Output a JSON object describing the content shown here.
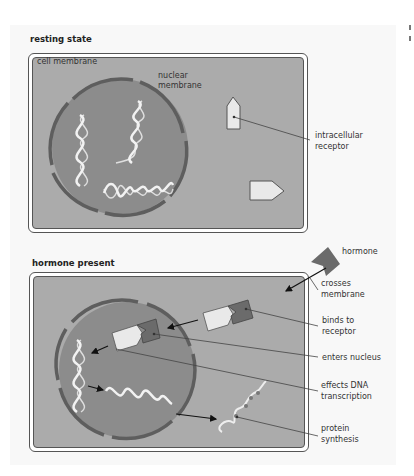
{
  "panels": [
    {
      "title": "resting state",
      "labels": {
        "cell_membrane": "cell membrane",
        "nuclear_membrane_1": "nuclear",
        "nuclear_membrane_2": "membrane",
        "dna": "DNA",
        "intracellular_receptor_1": "intracellular",
        "intracellular_receptor_2": "receptor"
      }
    },
    {
      "title": "hormone present",
      "labels": {
        "hormone": "hormone",
        "mrna": "mRNA",
        "steps": [
          {
            "line1": "crosses",
            "line2": "membrane"
          },
          {
            "line1": "binds to",
            "line2": "receptor"
          },
          {
            "line1": "enters nucleus",
            "line2": ""
          },
          {
            "line1": "effects DNA",
            "line2": "transcription"
          },
          {
            "line1": "protein",
            "line2": "synthesis"
          }
        ]
      }
    }
  ],
  "colors": {
    "cytoplasm": "#ababab",
    "nucleus": "#8c8c8c",
    "nuclear_membrane": "#5e5e5e",
    "hormone": "#6b6b6b",
    "receptor": "#e9e9e9",
    "helix": "#f2f2f2"
  }
}
